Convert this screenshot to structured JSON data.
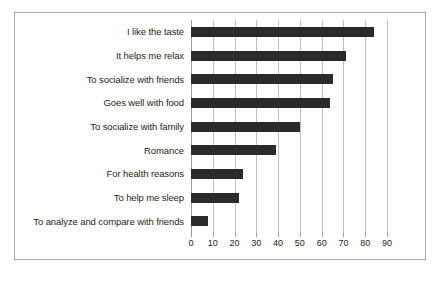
{
  "chart_data": {
    "type": "bar",
    "orientation": "horizontal",
    "title": "",
    "xlabel": "",
    "ylabel": "",
    "xlim": [
      0,
      90
    ],
    "xticks": [
      0,
      10,
      20,
      30,
      40,
      50,
      60,
      70,
      80,
      90
    ],
    "grid": true,
    "legend": false,
    "bar_color": "#2b2b2b",
    "grid_color": "#bfbfbf",
    "background_color": "#ffffff",
    "border_color": "#a8a8a8",
    "categories": [
      "I like the taste",
      "It helps me relax",
      "To socialize with friends",
      "Goes well with food",
      "To socialize with family",
      "Romance",
      "For health reasons",
      "To help me sleep",
      "To analyze and compare with friends"
    ],
    "values": [
      84,
      71,
      65,
      64,
      50,
      39,
      24,
      22,
      8
    ]
  }
}
